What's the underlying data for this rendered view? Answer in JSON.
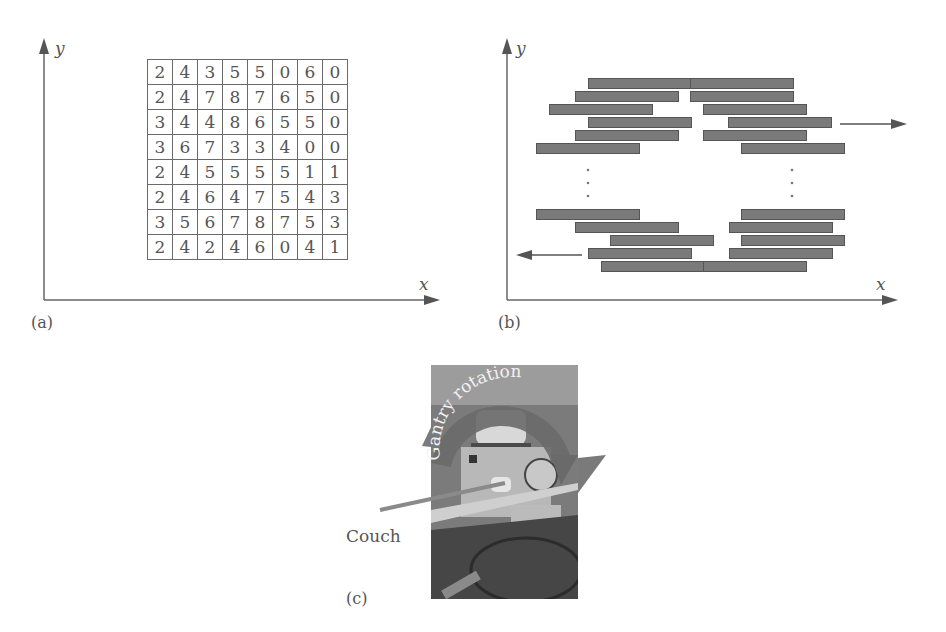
{
  "panel_a": {
    "label": "(a)",
    "x_axis": "x",
    "y_axis": "y",
    "intensity_matrix": [
      [
        2,
        4,
        3,
        5,
        5,
        0,
        6,
        0
      ],
      [
        2,
        4,
        7,
        8,
        7,
        6,
        5,
        0
      ],
      [
        3,
        4,
        4,
        8,
        6,
        5,
        5,
        0
      ],
      [
        3,
        6,
        7,
        3,
        3,
        4,
        0,
        0
      ],
      [
        2,
        4,
        5,
        5,
        5,
        5,
        1,
        1
      ],
      [
        2,
        4,
        6,
        4,
        7,
        5,
        4,
        3
      ],
      [
        3,
        5,
        6,
        7,
        8,
        7,
        5,
        3
      ],
      [
        2,
        4,
        2,
        4,
        6,
        0,
        4,
        1
      ]
    ]
  },
  "panel_b": {
    "label": "(b)",
    "x_axis": "x",
    "y_axis": "y",
    "description": "Multileaf collimator leaves; left bank moves left, right bank moves right",
    "arrow_right": "leaf motion right",
    "arrow_left": "leaf motion left",
    "ellipsis": "⋮"
  },
  "panel_c": {
    "label": "(c)",
    "gantry_label": "Gantry rotation",
    "couch_label": "Couch"
  }
}
